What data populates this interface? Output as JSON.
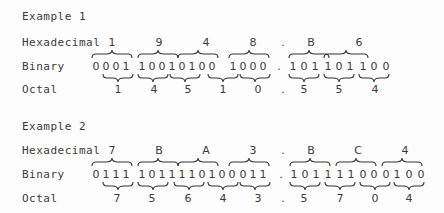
{
  "examples": [
    {
      "title": "Example 1",
      "row_labels": {
        "hex": "Hexadecimal",
        "binary": "Binary",
        "octal": "Octal"
      },
      "hex_digits": [
        "1",
        "9",
        "4",
        "8",
        ".",
        "B",
        "6"
      ],
      "binary_digits": [
        "0",
        "0",
        "0",
        "1",
        "1",
        "0",
        "0",
        "1",
        "0",
        "1",
        "0",
        "0",
        "1",
        "0",
        "0",
        "0",
        ".",
        "1",
        "0",
        "1",
        "1",
        "0",
        "1",
        "1",
        "0",
        "0"
      ],
      "octal_digits": [
        "1",
        "4",
        "5",
        "1",
        "0",
        ".",
        "5",
        "5",
        "4"
      ]
    },
    {
      "title": "Example 2",
      "row_labels": {
        "hex": "Hexadecimal",
        "binary": "Binary",
        "octal": "Octal"
      },
      "hex_digits": [
        "7",
        "B",
        "A",
        "3",
        ".",
        "B",
        "C",
        "4"
      ],
      "binary_digits": [
        "0",
        "1",
        "1",
        "1",
        "1",
        "0",
        "1",
        "1",
        "1",
        "1",
        "0",
        "1",
        "0",
        "0",
        "0",
        "1",
        "1",
        ".",
        "1",
        "0",
        "1",
        "1",
        "1",
        "1",
        "0",
        "0",
        "0",
        "1",
        "0",
        "0"
      ],
      "octal_digits": [
        "7",
        "5",
        "6",
        "4",
        "3",
        ".",
        "5",
        "7",
        "0",
        "4"
      ]
    }
  ]
}
